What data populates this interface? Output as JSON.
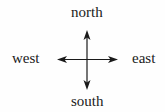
{
  "diagram": {
    "type": "compass-directions",
    "labels": {
      "north": "north",
      "south": "south",
      "east": "east",
      "west": "west"
    },
    "colors": {
      "stroke": "#1a1a1a",
      "text": "#1a1a1a",
      "background": "#fefefe"
    }
  }
}
